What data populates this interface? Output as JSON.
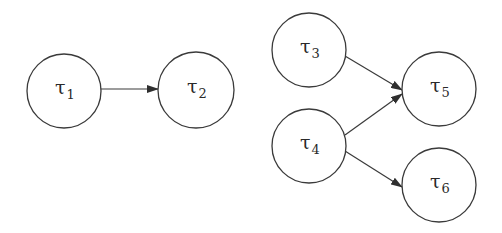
{
  "diagram": {
    "type": "directed-graph",
    "stroke_color": "#3a3a3a",
    "background": "#ffffff",
    "nodes": [
      {
        "id": "t1",
        "symbol": "τ",
        "subscript": "1",
        "cx": 64,
        "cy": 91,
        "r": 37
      },
      {
        "id": "t2",
        "symbol": "τ",
        "subscript": "2",
        "cx": 196,
        "cy": 90,
        "r": 38
      },
      {
        "id": "t3",
        "symbol": "τ",
        "subscript": "3",
        "cx": 309,
        "cy": 50,
        "r": 37
      },
      {
        "id": "t4",
        "symbol": "τ",
        "subscript": "4",
        "cx": 309,
        "cy": 146,
        "r": 37
      },
      {
        "id": "t5",
        "symbol": "τ",
        "subscript": "5",
        "cx": 439,
        "cy": 89,
        "r": 37
      },
      {
        "id": "t6",
        "symbol": "τ",
        "subscript": "6",
        "cx": 439,
        "cy": 185,
        "r": 37
      }
    ],
    "edges": [
      {
        "from": "t1",
        "to": "t2",
        "x1": 101,
        "y1": 89,
        "x2": 158,
        "y2": 89
      },
      {
        "from": "t3",
        "to": "t5",
        "x1": 345,
        "y1": 56,
        "x2": 402,
        "y2": 90
      },
      {
        "from": "t4",
        "to": "t5",
        "x1": 345,
        "y1": 135,
        "x2": 402,
        "y2": 94
      },
      {
        "from": "t4",
        "to": "t6",
        "x1": 345,
        "y1": 151,
        "x2": 402,
        "y2": 187
      }
    ]
  }
}
